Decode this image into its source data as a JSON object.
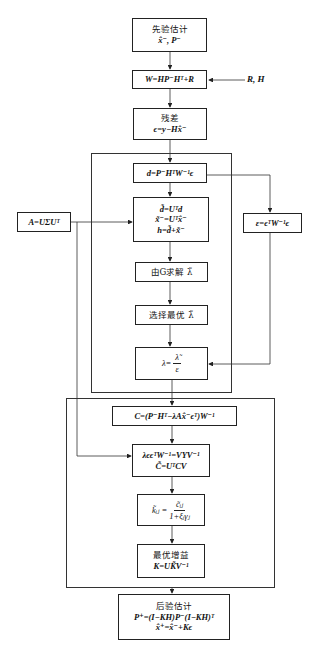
{
  "diagram": {
    "nodes": {
      "prior": {
        "title": "先验估计",
        "formula": "x̂⁻, P⁻"
      },
      "w": {
        "formula": "W=HP⁻Hᵀ+R"
      },
      "rh_input": {
        "label": "R, H"
      },
      "residual": {
        "title": "残差",
        "formula": "ϵ=y−Hx̂⁻"
      },
      "d": {
        "formula": "d=P⁻HᵀW⁻¹ϵ"
      },
      "transform": {
        "line1": "d̃=Uᵀd",
        "line2": "x̃⁻=Uᵀx̂⁻",
        "line3": "h=d̃+x̃⁻"
      },
      "svd": {
        "formula": "A=UΣUᵀ"
      },
      "epsilon": {
        "formula": "ε=ϵᵀW⁻¹ϵ"
      },
      "solve": {
        "label": "由G求解 λ̃"
      },
      "select": {
        "label": "选择最优 λ̃"
      },
      "lambda": {
        "lhs": "λ=",
        "num": "λ̃",
        "den": "ε"
      },
      "c": {
        "formula": "C=(P⁻Hᵀ−λAx̂⁻ϵᵀ)W⁻¹"
      },
      "eig": {
        "line1": "λϵϵᵀW⁻¹=VΥV⁻¹",
        "line2": "C̃=UᵀCV"
      },
      "k_tilde": {
        "lhs": "k̃ᵢⱼ =",
        "num": "c̃ᵢⱼ",
        "den": "1+ξᵢγⱼ"
      },
      "gain": {
        "title": "最优增益",
        "formula": "K=UK̃V⁻¹"
      },
      "posterior": {
        "title": "后验估计",
        "line1": "P⁺=(I−KH)P⁻(I−KH)ᵀ",
        "line2": "x̂⁺=x̂⁻+Kϵ"
      }
    },
    "caption": ""
  }
}
